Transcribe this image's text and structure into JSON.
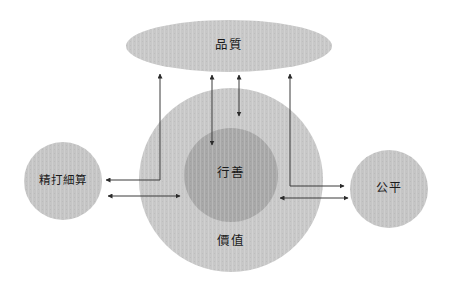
{
  "diagram": {
    "title": "",
    "background_color": "#ffffff",
    "palette": {
      "outer_fill": "#c8c8c8",
      "inner_fill": "#a8a8a8",
      "ellipse_fill": "#c8c8c8",
      "side_circle_fill": "#c5c5c5",
      "stroke": "#3a3a3a",
      "text": "#1a1a1a"
    },
    "nodes": [
      {
        "id": "quality",
        "label": "品質",
        "shape": "ellipse",
        "cx": 229,
        "cy": 46,
        "rx": 103,
        "ry": 26,
        "fill": "#c8c8c8",
        "label_x": 229,
        "label_y": 46
      },
      {
        "id": "value",
        "label": "價值",
        "shape": "circle",
        "cx": 231,
        "cy": 180,
        "r": 92,
        "fill": "#c8c8c8",
        "label_x": 231,
        "label_y": 242
      },
      {
        "id": "charity",
        "label": "行善",
        "shape": "circle",
        "cx": 231,
        "cy": 175,
        "r": 47,
        "fill": "#a8a8a8",
        "label_x": 231,
        "label_y": 174
      },
      {
        "id": "frugality",
        "label": "精打細算",
        "shape": "circle",
        "cx": 63,
        "cy": 181,
        "r": 39,
        "fill": "#c5c5c5",
        "label_x": 63,
        "label_y": 181
      },
      {
        "id": "fairness",
        "label": "公平",
        "shape": "circle",
        "cx": 389,
        "cy": 189,
        "r": 39,
        "fill": "#c5c5c5",
        "label_x": 389,
        "label_y": 189
      }
    ],
    "connectors": [
      {
        "id": "quality-to-charity-long",
        "name": "arrow-quality-charity-double",
        "path": "M 212 75 L 212 145",
        "arrow_start": true,
        "arrow_end": true,
        "direction": "bidirectional"
      },
      {
        "id": "quality-to-value-short",
        "name": "arrow-quality-value-double",
        "path": "M 239 75 L 239 116",
        "arrow_start": true,
        "arrow_end": true,
        "direction": "bidirectional"
      },
      {
        "id": "frugality-elbow-up",
        "name": "arrow-frugality-quality-elbow",
        "path": "M 160 180 L 160 74",
        "arrow_start": false,
        "arrow_end": true,
        "direction": "upward"
      },
      {
        "id": "frugality-elbow-left",
        "name": "arrow-value-frugality-elbow",
        "path": "M 160 180 L 106 180",
        "arrow_start": false,
        "arrow_end": true,
        "direction": "leftward"
      },
      {
        "id": "fairness-elbow-up",
        "name": "arrow-fairness-quality-elbow",
        "path": "M 290 186 L 290 74",
        "arrow_start": false,
        "arrow_end": true,
        "direction": "upward"
      },
      {
        "id": "fairness-elbow-right",
        "name": "arrow-value-fairness-elbow",
        "path": "M 290 186 L 344 186",
        "arrow_start": false,
        "arrow_end": true,
        "direction": "rightward"
      },
      {
        "id": "frugality-value-horizontal",
        "name": "arrow-frugality-value-double",
        "path": "M 108 196 L 180 196",
        "arrow_start": true,
        "arrow_end": true,
        "direction": "bidirectional"
      },
      {
        "id": "value-fairness-horizontal",
        "name": "arrow-value-fairness-double",
        "path": "M 280 198 L 348 198",
        "arrow_start": true,
        "arrow_end": true,
        "direction": "bidirectional"
      }
    ]
  }
}
